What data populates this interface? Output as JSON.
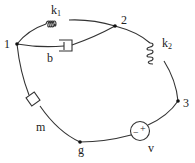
{
  "diagram": {
    "type": "mechanical-electrical-linear-graph",
    "nodes": [
      {
        "id": "1",
        "label": "1"
      },
      {
        "id": "2",
        "label": "2"
      },
      {
        "id": "3",
        "label": "3"
      },
      {
        "id": "g",
        "label": "g"
      }
    ],
    "elements": [
      {
        "id": "k1",
        "kind": "spring",
        "label": "k",
        "sub": "1",
        "from": "1",
        "to": "2"
      },
      {
        "id": "b",
        "kind": "damper",
        "label": "b",
        "from": "1",
        "to": "2"
      },
      {
        "id": "k2",
        "kind": "spring",
        "label": "k",
        "sub": "2",
        "from": "2",
        "to": "3"
      },
      {
        "id": "m",
        "kind": "mass",
        "label": "m",
        "from": "1",
        "to": "g"
      },
      {
        "id": "v",
        "kind": "voltage-source",
        "label": "v",
        "from": "g",
        "to": "3",
        "minus": "−",
        "plus": "+"
      }
    ]
  }
}
